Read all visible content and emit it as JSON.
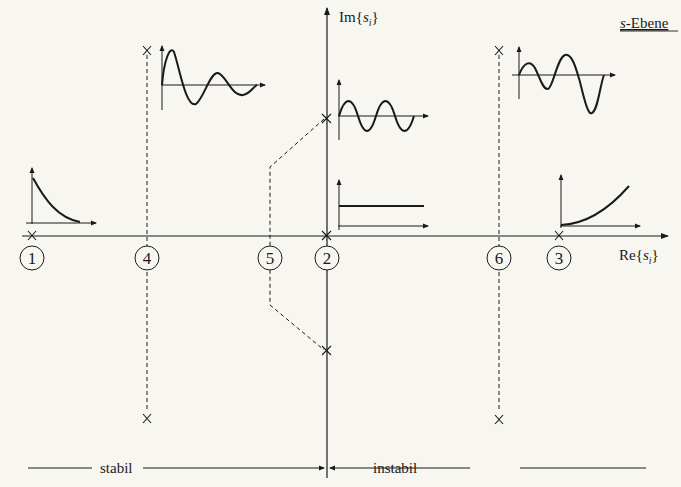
{
  "diagram": {
    "title": "s-Ebene",
    "title_italic_part": "s",
    "title_rest": "-Ebene",
    "axes": {
      "real_label_prefix": "Re{",
      "real_label_var": "s",
      "real_label_sub": "i",
      "real_label_suffix": "}",
      "imag_label_prefix": "Im{",
      "imag_label_var": "s",
      "imag_label_sub": "i",
      "imag_label_suffix": "}"
    },
    "regions": {
      "left_label": "stabil",
      "right_label": "instabil"
    },
    "poles": [
      {
        "id": "1",
        "label": "1",
        "type": "real negative",
        "response": "decaying exponential"
      },
      {
        "id": "2",
        "label": "2",
        "type": "origin",
        "response": "constant step"
      },
      {
        "id": "3",
        "label": "3",
        "type": "real positive",
        "response": "growing exponential"
      },
      {
        "id": "4",
        "label": "4",
        "type": "complex conjugate, negative real part",
        "response": "damped oscillation"
      },
      {
        "id": "5",
        "label": "5",
        "type": "complex conjugate, imaginary axis",
        "response": "undamped oscillation"
      },
      {
        "id": "6",
        "label": "6",
        "type": "complex conjugate, positive real part",
        "response": "growing oscillation"
      }
    ],
    "colors": {
      "background": "#f7f6f0",
      "ink": "#1a1a1a"
    }
  }
}
